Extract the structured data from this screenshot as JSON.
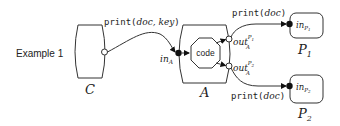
{
  "example_label": "Example 1",
  "components": {
    "client": {
      "label": "C"
    },
    "agent": {
      "label": "A",
      "inner": "code"
    },
    "printer1": {
      "label": "P",
      "label_sub": "1",
      "port": "in",
      "port_sub": "P",
      "port_subsub": "1"
    },
    "printer2": {
      "label": "P",
      "label_sub": "2",
      "port": "in",
      "port_sub": "P",
      "port_subsub": "2"
    }
  },
  "ports": {
    "agent_in": {
      "name": "in",
      "sub": "A"
    },
    "agent_out1": {
      "name": "out",
      "sup": "P",
      "sup_sub": "1",
      "sub": "A"
    },
    "agent_out2": {
      "name": "out",
      "sup": "P",
      "sup_sub": "2",
      "sub": "A"
    }
  },
  "messages": {
    "c_to_a": {
      "fn": "print",
      "open": "(",
      "args": "doc, key",
      "close": ")"
    },
    "a_to_p1": {
      "fn": "print",
      "open": "(",
      "args": "doc",
      "close": ")"
    },
    "a_to_p2": {
      "fn": "print",
      "open": "(",
      "args": "doc",
      "close": ")"
    }
  },
  "colors": {
    "stroke": "#333333",
    "text": "#222222",
    "fill": "#ffffff",
    "dot": "#111111"
  }
}
